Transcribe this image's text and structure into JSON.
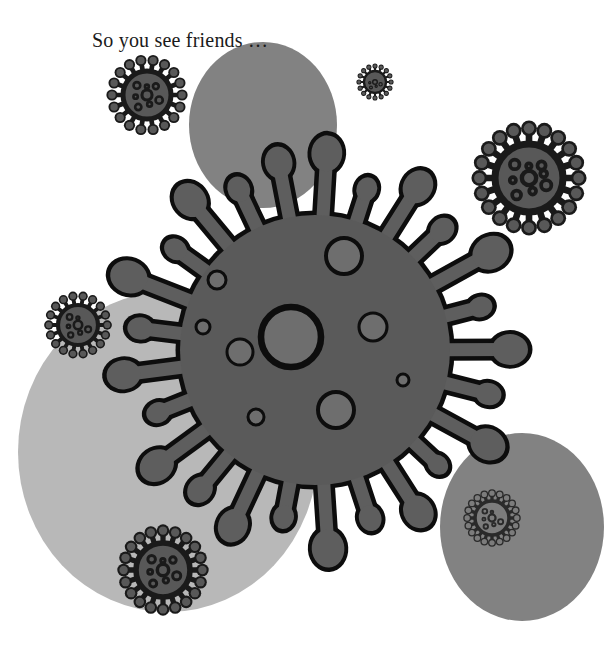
{
  "page": {
    "width": 613,
    "height": 646,
    "background_color": "#ffffff",
    "kind": "illustration"
  },
  "caption": {
    "text": "So you see friends …",
    "x": 92,
    "y": 28,
    "font_size": 20,
    "color": "#1a1a1a"
  },
  "palette": {
    "background": "#ffffff",
    "outline": "#0d0d0d",
    "virus_body": "#5a5a5a",
    "virus_spike": "#5e5e5e",
    "virus_pore": "#6e6e6e",
    "blob_light": "#b8b8b8",
    "blob_medium": "#828282",
    "small_virus_body": "#585858",
    "small_virus_outline": "#1a1a1a"
  },
  "blobs": [
    {
      "name": "blob-top-center",
      "cx": 263,
      "cy": 125,
      "rx": 74,
      "ry": 83,
      "color": "#828282"
    },
    {
      "name": "blob-left-large",
      "cx": 168,
      "cy": 452,
      "rx": 150,
      "ry": 160,
      "color": "#b8b8b8"
    },
    {
      "name": "blob-bottom-right",
      "cx": 522,
      "cy": 527,
      "rx": 82,
      "ry": 94,
      "color": "#828282"
    }
  ],
  "main_virus": {
    "name": "main-coronavirus",
    "cx": 315,
    "cy": 350,
    "body_radius": 135,
    "body_color": "#5a5a5a",
    "outline_color": "#0d0d0d",
    "outline_width": 9,
    "spike_count": 25,
    "pores": [
      {
        "cx": 344,
        "cy": 256,
        "r": 18
      },
      {
        "cx": 291,
        "cy": 337,
        "r": 30
      },
      {
        "cx": 217,
        "cy": 280,
        "r": 9
      },
      {
        "cx": 240,
        "cy": 352,
        "r": 13
      },
      {
        "cx": 203,
        "cy": 327,
        "r": 7
      },
      {
        "cx": 373,
        "cy": 327,
        "r": 14
      },
      {
        "cx": 336,
        "cy": 410,
        "r": 18
      },
      {
        "cx": 256,
        "cy": 417,
        "r": 8
      },
      {
        "cx": 403,
        "cy": 380,
        "r": 6
      }
    ]
  },
  "small_viruses": [
    {
      "name": "small-virus-upper-left",
      "cx": 147,
      "cy": 95,
      "r": 24,
      "spikes": 18,
      "fill": "#585858",
      "stroke": "#1a1a1a",
      "pores": 7
    },
    {
      "name": "small-virus-top-tiny",
      "cx": 375,
      "cy": 82,
      "r": 11,
      "spikes": 16,
      "fill": "#585858",
      "stroke": "#1a1a1a",
      "pores": 4
    },
    {
      "name": "small-virus-right",
      "cx": 529,
      "cy": 178,
      "r": 34,
      "spikes": 20,
      "fill": "#585858",
      "stroke": "#1a1a1a",
      "pores": 8
    },
    {
      "name": "small-virus-left",
      "cx": 78,
      "cy": 325,
      "r": 20,
      "spikes": 18,
      "fill": "#585858",
      "stroke": "#1a1a1a",
      "pores": 6
    },
    {
      "name": "small-virus-bottom-left",
      "cx": 163,
      "cy": 570,
      "r": 27,
      "spikes": 20,
      "fill": "#585858",
      "stroke": "#1a1a1a",
      "pores": 7
    },
    {
      "name": "small-virus-on-blob",
      "cx": 492,
      "cy": 518,
      "r": 17,
      "spikes": 20,
      "fill": "#7c7c7c",
      "stroke": "#2a2a2a",
      "pores": 6
    }
  ]
}
